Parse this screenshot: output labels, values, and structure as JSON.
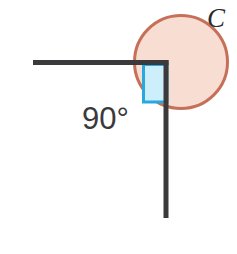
{
  "diagram": {
    "background_color": "#ffffff",
    "width": 237,
    "height": 254,
    "labels": {
      "angle_measure": "90°",
      "vertex": "C"
    },
    "colors": {
      "ray_stroke": "#3a3a3c",
      "circle_stroke": "#c6705a",
      "circle_fill": "#f8ded2",
      "right_angle_marker_stroke": "#29a8e0",
      "right_angle_marker_fill": "#cdeefb",
      "angle_label_color": "#3a3a3c",
      "vertex_label_color": "#2c2c2e"
    },
    "geometry": {
      "vertex": {
        "x": 166,
        "y": 62
      },
      "horizontal_ray": {
        "x1": 33,
        "y1": 62,
        "x2": 166,
        "y2": 62,
        "stroke_width": 5
      },
      "vertical_ray": {
        "x1": 166,
        "y1": 62,
        "x2": 166,
        "y2": 218,
        "stroke_width": 5
      },
      "circle": {
        "cx": 181,
        "cy": 62,
        "r": 48,
        "stroke_width": 3
      },
      "right_angle_marker": {
        "x": 142,
        "y": 63,
        "width": 25,
        "height": 39,
        "stroke_width": 3
      },
      "angle_label_position": {
        "x": 82,
        "y": 129
      },
      "vertex_label_position": {
        "x": 207,
        "y": 27
      }
    }
  }
}
